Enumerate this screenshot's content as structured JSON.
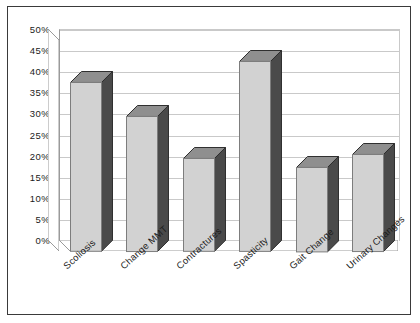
{
  "chart_data": {
    "type": "bar",
    "title": "",
    "subtitle": "",
    "xlabel": "",
    "ylabel": "",
    "categories": [
      "Scoliosis",
      "Change MMT",
      "Contractures",
      "Spasticity",
      "Gait Change",
      "Urinary Changes"
    ],
    "values": [
      40,
      32,
      22,
      45,
      20,
      23
    ],
    "value_labels": [
      "40%",
      "32%",
      "22%",
      "45%",
      "20%",
      "23%"
    ],
    "ylim": [
      0,
      50
    ],
    "ytick_step": 5,
    "ytick_labels": [
      "50%",
      "45%",
      "40%",
      "35%",
      "30%",
      "25%",
      "20%",
      "15%",
      "10%",
      "5%",
      "0%"
    ],
    "ytick_values": [
      50,
      45,
      40,
      35,
      30,
      25,
      20,
      15,
      10,
      5,
      0
    ],
    "grid": true,
    "grid_axis": "y",
    "legend": false,
    "legend_position": "none",
    "style": "3d-column",
    "series": [
      {
        "name": "",
        "values": [
          40,
          32,
          22,
          45,
          20,
          23
        ]
      }
    ]
  },
  "colors": {
    "bar_front": "#d2d2d2",
    "bar_side": "#4a4a4a",
    "bar_top": "#8f8f8f",
    "bar_outline": "#7d7d7d",
    "gridline": "#c9c9c9",
    "axis": "#9a9a9a",
    "border": "#3a3a3a",
    "background": "#ffffff",
    "text": "#1a1a1a"
  }
}
